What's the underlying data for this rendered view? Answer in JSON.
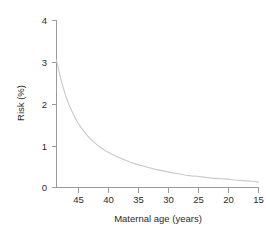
{
  "chart_data": {
    "type": "line",
    "title": "",
    "subtitle": "",
    "xlabel": "Maternal age (years)",
    "ylabel": "Risk (%)",
    "xlim": [
      48,
      15
    ],
    "ylim": [
      0,
      4
    ],
    "x_reversed": true,
    "grid": false,
    "legend": null,
    "legend_position": "none",
    "xticks": [
      45,
      40,
      35,
      30,
      25,
      20,
      15
    ],
    "xtick_labels": [
      "45",
      "40",
      "35",
      "30",
      "25",
      "20",
      "15"
    ],
    "yticks": [
      0,
      1,
      2,
      3,
      4
    ],
    "ytick_labels": [
      "0",
      "1",
      "2",
      "3",
      "4"
    ],
    "series": [
      {
        "name": "Risk",
        "color": "#c9c9c9",
        "x": [
          48,
          47.5,
          47,
          46.5,
          46,
          45.5,
          45,
          44.5,
          44,
          43.5,
          43,
          42.5,
          42,
          41.5,
          41,
          40.5,
          40,
          39,
          38,
          37,
          36,
          35,
          34,
          33,
          32,
          31,
          30,
          29,
          28,
          27,
          26,
          25,
          24,
          23,
          22,
          21,
          20,
          19,
          18,
          17,
          16,
          15
        ],
        "y": [
          3.05,
          2.72,
          2.44,
          2.2,
          2.0,
          1.83,
          1.68,
          1.55,
          1.44,
          1.34,
          1.25,
          1.17,
          1.1,
          1.04,
          0.98,
          0.93,
          0.88,
          0.8,
          0.73,
          0.67,
          0.61,
          0.56,
          0.52,
          0.48,
          0.44,
          0.41,
          0.38,
          0.35,
          0.33,
          0.3,
          0.28,
          0.27,
          0.25,
          0.23,
          0.22,
          0.21,
          0.2,
          0.18,
          0.17,
          0.16,
          0.15,
          0.13
        ]
      }
    ],
    "annotations": [],
    "colors": {
      "curve": "#c9c9c9",
      "axis": "#9a9a9a",
      "text": "#2b2b2b",
      "background": "#ffffff"
    }
  },
  "axes": {
    "x_title": "Maternal age (years)",
    "y_title": "Risk (%)",
    "x_tick_labels": [
      "45",
      "40",
      "35",
      "30",
      "25",
      "20",
      "15"
    ],
    "y_tick_labels": [
      "4",
      "3",
      "2",
      "1",
      "0"
    ]
  }
}
